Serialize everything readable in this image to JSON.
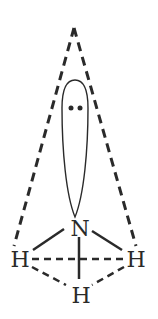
{
  "diagram": {
    "atoms": {
      "central": "N",
      "hydrogen_left": "H",
      "hydrogen_right": "H",
      "hydrogen_bottom": "H"
    },
    "lone_pair_symbol": "••",
    "colors": {
      "ink": "#2a2a2a",
      "background": "#ffffff"
    }
  }
}
